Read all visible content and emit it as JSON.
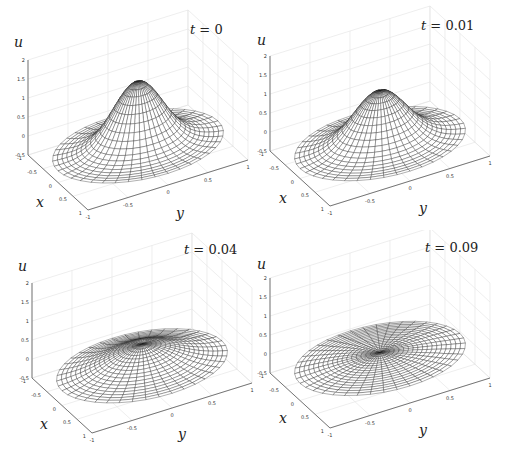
{
  "chart_data": [
    {
      "type": "surface",
      "title": "t = 0",
      "title_var": "t",
      "title_value": "0",
      "xlabel": "x",
      "ylabel": "y",
      "zlabel": "u",
      "xticks": [
        "-1",
        "-0.5",
        "0",
        "0.5",
        "1"
      ],
      "yticks": [
        "-1",
        "-0.5",
        "0",
        "0.5",
        "1"
      ],
      "zticks": [
        "-0.5",
        "0",
        "0.5",
        "1",
        "1.5",
        "2"
      ],
      "xlim": [
        -1,
        1
      ],
      "ylim": [
        -1,
        1
      ],
      "zlim": [
        -0.5,
        2
      ],
      "peak_u": 1.5,
      "edge_u": -0.2,
      "ring_min_u": -0.3,
      "profile_width": 0.42,
      "grid": true
    },
    {
      "type": "surface",
      "title": "t = 0.01",
      "title_var": "t",
      "title_value": "0.01",
      "xlabel": "x",
      "ylabel": "y",
      "zlabel": "u",
      "xticks": [
        "-1",
        "-0.5",
        "0",
        "0.5",
        "1"
      ],
      "yticks": [
        "-1",
        "-0.5",
        "0",
        "0.5",
        "1"
      ],
      "zticks": [
        "-0.5",
        "0",
        "0.5",
        "1",
        "1.5",
        "2"
      ],
      "xlim": [
        -1,
        1
      ],
      "ylim": [
        -1,
        1
      ],
      "zlim": [
        -0.5,
        2
      ],
      "peak_u": 1.15,
      "edge_u": -0.25,
      "ring_min_u": -0.25,
      "profile_width": 0.45,
      "grid": true
    },
    {
      "type": "surface",
      "title": "t = 0.04",
      "title_var": "t",
      "title_value": "0.04",
      "xlabel": "x",
      "ylabel": "y",
      "zlabel": "u",
      "xticks": [
        "-1",
        "-0.5",
        "0",
        "0.5",
        "1"
      ],
      "yticks": [
        "-1",
        "-0.5",
        "0",
        "0.5",
        "1"
      ],
      "zticks": [
        "-0.5",
        "0",
        "0.5",
        "1",
        "1.5",
        "2"
      ],
      "xlim": [
        -1,
        1
      ],
      "ylim": [
        -1,
        1
      ],
      "zlim": [
        -0.5,
        2
      ],
      "peak_u": 0.45,
      "edge_u": -0.15,
      "ring_min_u": -0.15,
      "profile_width": 0.6,
      "grid": true
    },
    {
      "type": "surface",
      "title": "t = 0.09",
      "title_var": "t",
      "title_value": "0.09",
      "xlabel": "x",
      "ylabel": "y",
      "zlabel": "u",
      "xticks": [
        "-1",
        "-0.5",
        "0",
        "0.5",
        "1"
      ],
      "yticks": [
        "-1",
        "-0.5",
        "0",
        "0.5",
        "1"
      ],
      "zticks": [
        "-0.5",
        "0",
        "0.5",
        "1",
        "1.5",
        "2"
      ],
      "xlim": [
        -1,
        1
      ],
      "ylim": [
        -1,
        1
      ],
      "zlim": [
        -0.5,
        2
      ],
      "peak_u": 0.1,
      "edge_u": -0.2,
      "ring_min_u": -0.2,
      "profile_width": 1.2,
      "grid": true
    }
  ],
  "panels": [
    {
      "title_var": "t",
      "title_rest": " = 0",
      "xlabel": "x",
      "ylabel": "y",
      "zlabel": "u"
    },
    {
      "title_var": "t",
      "title_rest": " = 0.01",
      "xlabel": "x",
      "ylabel": "y",
      "zlabel": "u"
    },
    {
      "title_var": "t",
      "title_rest": " = 0.04",
      "xlabel": "x",
      "ylabel": "y",
      "zlabel": "u"
    },
    {
      "title_var": "t",
      "title_rest": " = 0.09",
      "xlabel": "x",
      "ylabel": "y",
      "zlabel": "u"
    }
  ],
  "colors": {
    "wire": "#1a1a1a",
    "face": "#ffffff",
    "grid": "#e2e2e2",
    "axis": "#555555",
    "tick_text": "#333333"
  }
}
